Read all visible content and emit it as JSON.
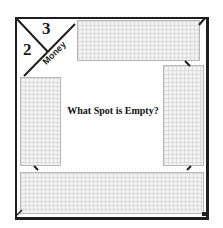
{
  "board": {
    "corner": {
      "number_top": "3",
      "number_left": "2",
      "label": "Money"
    },
    "question": "What Spot is Empty?",
    "spaces": [
      {
        "id": "top",
        "label": ""
      },
      {
        "id": "left",
        "label": ""
      },
      {
        "id": "right",
        "label": ""
      },
      {
        "id": "bottom",
        "label": ""
      }
    ],
    "colors": {
      "frame": "#1e1e1e",
      "space_fill": "#f3f3f3",
      "grid": "#dcdcdc",
      "space_border": "#b8b8b8"
    }
  }
}
